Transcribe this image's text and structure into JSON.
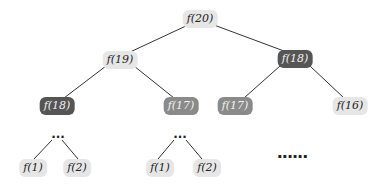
{
  "diagram": {
    "title": "",
    "type": "recursion tree",
    "nodes": [
      {
        "id": "n20",
        "label": "f(20)",
        "shade": "light"
      },
      {
        "id": "n19",
        "label": "f(19)",
        "shade": "light"
      },
      {
        "id": "n18r",
        "label": "f(18)",
        "shade": "dark"
      },
      {
        "id": "n18l",
        "label": "f(18)",
        "shade": "dark"
      },
      {
        "id": "n17a",
        "label": "f(17)",
        "shade": "medium"
      },
      {
        "id": "n17b",
        "label": "f(17)",
        "shade": "medium"
      },
      {
        "id": "n16",
        "label": "f(16)",
        "shade": "light"
      },
      {
        "id": "n1a",
        "label": "f(1)",
        "shade": "light"
      },
      {
        "id": "n2a",
        "label": "f(2)",
        "shade": "light"
      },
      {
        "id": "n1b",
        "label": "f(1)",
        "shade": "light"
      },
      {
        "id": "n2b",
        "label": "f(2)",
        "shade": "light"
      }
    ],
    "ellipsis_short": "...",
    "ellipsis_long": "......",
    "colors": {
      "light": "#e6e6e6",
      "medium": "#8a8a8a",
      "dark": "#555555",
      "edge": "#333333"
    }
  }
}
